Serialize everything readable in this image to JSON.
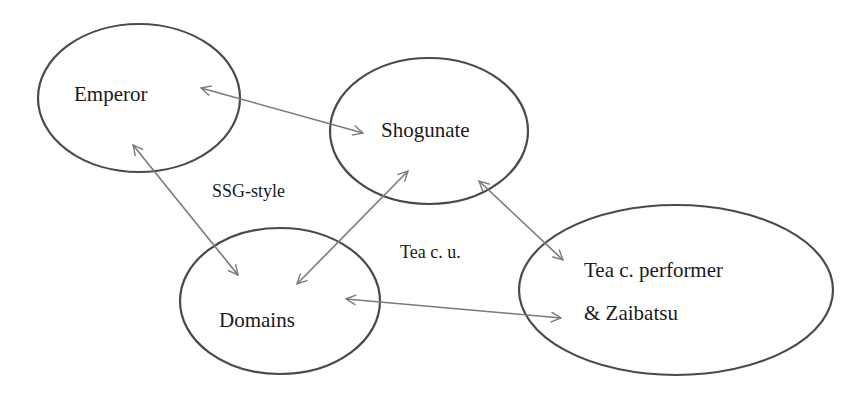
{
  "nodes": {
    "emperor": {
      "label": "Emperor"
    },
    "shogunate": {
      "label": "Shogunate"
    },
    "domains": {
      "label": "Domains"
    },
    "tea": {
      "label_line1": "Tea c. performer",
      "label_line2": "& Zaibatsu"
    }
  },
  "edge_labels": {
    "ssg_style": "SSG-style",
    "tea_cu": "Tea c. u."
  },
  "edges": [
    {
      "from": "Emperor",
      "to": "Shogunate",
      "direction": "bidirectional"
    },
    {
      "from": "Emperor",
      "to": "Domains",
      "direction": "bidirectional"
    },
    {
      "from": "Shogunate",
      "to": "Domains",
      "direction": "bidirectional"
    },
    {
      "from": "Shogunate",
      "to": "Tea c. performer & Zaibatsu",
      "direction": "bidirectional"
    },
    {
      "from": "Domains",
      "to": "Tea c. performer & Zaibatsu",
      "direction": "bidirectional"
    }
  ],
  "colors": {
    "ellipse_stroke": "#4a4a4a",
    "arrow_stroke": "#7a7a7a",
    "text": "#1a1a1a",
    "background": "#ffffff"
  }
}
